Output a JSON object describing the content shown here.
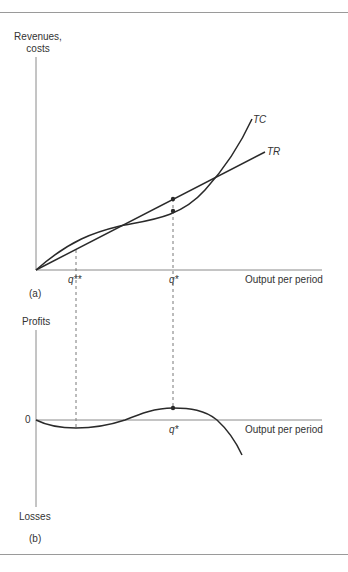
{
  "figure": {
    "panel_a": {
      "tag": "(a)",
      "y_axis_label_line1": "Revenues,",
      "y_axis_label_line2": "costs",
      "x_axis_label": "Output per period",
      "curve_labels": {
        "tc": "TC",
        "tr": "TR"
      },
      "x_ticks": {
        "q_double_star": "q**",
        "q_star": "q*"
      }
    },
    "panel_b": {
      "tag": "(b)",
      "y_axis_top_label": "Profits",
      "y_axis_bottom_label": "Losses",
      "zero_label": "0",
      "x_axis_label": "Output per period",
      "x_ticks": {
        "q_star": "q*"
      }
    },
    "colors": {
      "curve": "#2a2a2a",
      "axis": "#8a8a8a",
      "rule": "#9a9a9a",
      "background": "#ffffff"
    }
  }
}
